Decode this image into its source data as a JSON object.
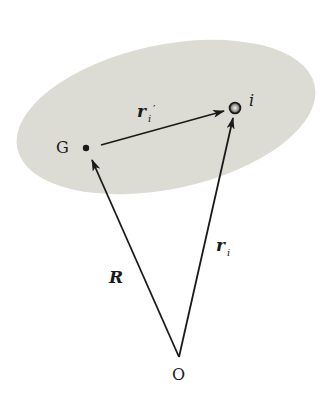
{
  "diagram": {
    "type": "vector-diagram",
    "colors": {
      "body_fill": "#dcdcd4",
      "ink": "#1a1a1a",
      "background": "#ffffff"
    },
    "points": {
      "G": {
        "label": "G",
        "x": 86,
        "y": 148
      },
      "i": {
        "label": "i",
        "x": 235,
        "y": 108
      },
      "O": {
        "label": "O",
        "x": 179,
        "y": 357
      }
    },
    "vectors": [
      {
        "name": "R",
        "label": "R",
        "from": "O",
        "to": "G"
      },
      {
        "name": "r_i",
        "label": "r",
        "subscript": "i",
        "from": "O",
        "to": "i"
      },
      {
        "name": "r_i_prime",
        "label": "r",
        "subscript": "i",
        "prime": "′",
        "from": "G",
        "to": "i"
      }
    ]
  }
}
